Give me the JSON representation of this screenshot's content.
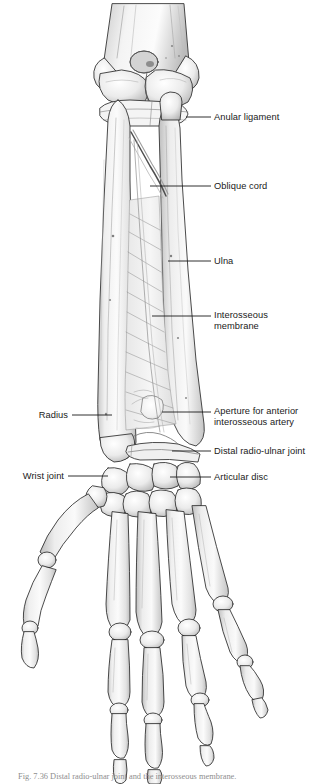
{
  "figure": {
    "view": "anterior view",
    "background_color": "#ffffff",
    "line_color": "#1a1a1a",
    "bone_fill": "#f2f2f2",
    "bone_shadow": "#b9b9b9",
    "bone_outline": "#2b2b2b",
    "caption_text": "Fig. 7.36  Distal radio-ulnar joint and the interosseous membrane."
  },
  "labels": [
    {
      "id": "anular-ligament",
      "text": "Anular ligament",
      "side": "right",
      "x": 214,
      "y": 112,
      "leader": {
        "x1": 186,
        "y1": 117,
        "x2": 211,
        "y2": 117
      }
    },
    {
      "id": "oblique-cord",
      "text": "Oblique cord",
      "side": "right",
      "x": 214,
      "y": 181,
      "leader": {
        "x1": 150,
        "y1": 186,
        "x2": 211,
        "y2": 186
      }
    },
    {
      "id": "ulna",
      "text": "Ulna",
      "side": "right",
      "x": 214,
      "y": 256,
      "leader": {
        "x1": 168,
        "y1": 261,
        "x2": 211,
        "y2": 261
      }
    },
    {
      "id": "interosseous-membrane",
      "text": "Interosseous\nmembrane",
      "side": "right",
      "x": 214,
      "y": 310,
      "leader": {
        "x1": 152,
        "y1": 316,
        "x2": 211,
        "y2": 316
      }
    },
    {
      "id": "aperture-anterior-interosseous-artery",
      "text": "Aperture for anterior\ninterosseous artery",
      "side": "right",
      "x": 214,
      "y": 406,
      "leader": {
        "x1": 162,
        "y1": 412,
        "x2": 211,
        "y2": 412
      }
    },
    {
      "id": "distal-radio-ulnar-joint",
      "text": "Distal radio-ulnar joint",
      "side": "right",
      "x": 214,
      "y": 446,
      "leader": {
        "x1": 172,
        "y1": 451,
        "x2": 211,
        "y2": 451
      }
    },
    {
      "id": "articular-disc",
      "text": "Articular disc",
      "side": "right",
      "x": 214,
      "y": 472,
      "leader": {
        "x1": 170,
        "y1": 477,
        "x2": 211,
        "y2": 477
      }
    },
    {
      "id": "radius",
      "text": "Radius",
      "side": "left",
      "x": 28,
      "y": 410,
      "leader": {
        "x1": 72,
        "y1": 415,
        "x2": 112,
        "y2": 415
      }
    },
    {
      "id": "wrist-joint",
      "text": "Wrist joint",
      "side": "left",
      "x": 22,
      "y": 471,
      "leader": {
        "x1": 68,
        "y1": 476,
        "x2": 108,
        "y2": 476
      }
    }
  ],
  "anatomy": {
    "structures": [
      "humerus",
      "trochlea",
      "capitulum",
      "coronoid fossa",
      "radius",
      "ulna",
      "radial head",
      "anular ligament",
      "oblique cord",
      "interosseous membrane",
      "distal radio-ulnar joint",
      "articular disc",
      "carpal bones",
      "metacarpals",
      "proximal phalanges",
      "middle phalanges",
      "distal phalanges",
      "thumb"
    ]
  }
}
